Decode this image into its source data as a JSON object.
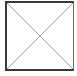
{
  "image_placeholder": {
    "icon": "broken-image-icon",
    "border_color": "#3a3a3a",
    "cross_color": "#a0a0a0"
  }
}
